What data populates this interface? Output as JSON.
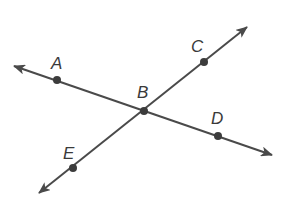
{
  "diagram": {
    "colors": {
      "line": "#4a4a4a",
      "point": "#3c3c3c",
      "label": "#3a3a3a",
      "background": "#ffffff"
    },
    "points": [
      {
        "name": "A",
        "label": "A",
        "x": 57,
        "y": 80
      },
      {
        "name": "B",
        "label": "B",
        "x": 144,
        "y": 111
      },
      {
        "name": "C",
        "label": "C",
        "x": 204,
        "y": 62
      },
      {
        "name": "D",
        "label": "D",
        "x": 218,
        "y": 136
      },
      {
        "name": "E",
        "label": "E",
        "x": 73,
        "y": 168
      }
    ],
    "lines": [
      {
        "name": "line-AD",
        "through": [
          "A",
          "B",
          "D"
        ],
        "arrows": "both"
      },
      {
        "name": "line-EC",
        "through": [
          "E",
          "B",
          "C"
        ],
        "arrows": "both"
      }
    ]
  }
}
